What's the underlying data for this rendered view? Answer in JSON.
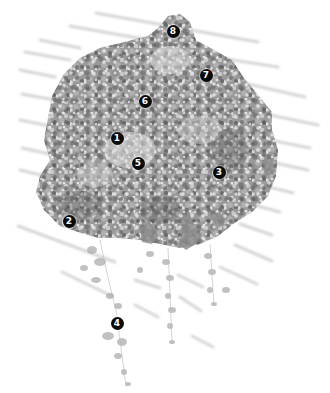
{
  "figure": {
    "palette": {
      "background": "#ffffff",
      "foliage_dark": "#5e5e5e",
      "foliage_mid": "#8c8c8c",
      "foliage_light": "#bdbdbd",
      "foliage_highlight": "#e2e2e2",
      "slat": "#c8c8c8",
      "marker_fill": "#0a0a0a",
      "marker_text": "#ffffff"
    },
    "markers": [
      {
        "label": "1",
        "x": 117,
        "y": 138
      },
      {
        "label": "2",
        "x": 69,
        "y": 221
      },
      {
        "label": "3",
        "x": 219,
        "y": 172
      },
      {
        "label": "4",
        "x": 117,
        "y": 323
      },
      {
        "label": "5",
        "x": 138,
        "y": 163
      },
      {
        "label": "6",
        "x": 145,
        "y": 101
      },
      {
        "label": "7",
        "x": 206,
        "y": 75
      },
      {
        "label": "8",
        "x": 173,
        "y": 31
      }
    ]
  }
}
